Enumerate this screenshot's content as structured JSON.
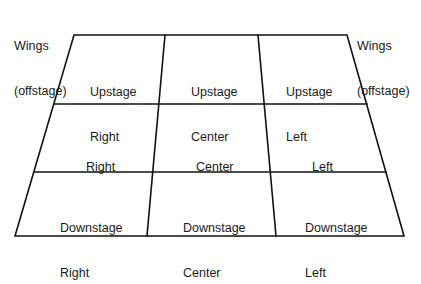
{
  "diagram": {
    "wings_left": {
      "line1": "Wings",
      "line2": "(offstage)"
    },
    "wings_right": {
      "line1": "Wings",
      "line2": "(offstage)"
    },
    "cells": [
      {
        "row": "upstage",
        "col": "right",
        "line1": "Upstage",
        "line2": "Right"
      },
      {
        "row": "upstage",
        "col": "center",
        "line1": "Upstage",
        "line2": "Center"
      },
      {
        "row": "upstage",
        "col": "left",
        "line1": "Upstage",
        "line2": "Left"
      },
      {
        "row": "middle",
        "col": "right",
        "line1": "Right",
        "line2": ""
      },
      {
        "row": "middle",
        "col": "center",
        "line1": "Center",
        "line2": ""
      },
      {
        "row": "middle",
        "col": "left",
        "line1": "Left",
        "line2": ""
      },
      {
        "row": "downstage",
        "col": "right",
        "line1": "Downstage",
        "line2": "Right"
      },
      {
        "row": "downstage",
        "col": "center",
        "line1": "Downstage",
        "line2": "Center"
      },
      {
        "row": "downstage",
        "col": "left",
        "line1": "Downstage",
        "line2": "Left"
      }
    ],
    "line_color": "#111111"
  }
}
